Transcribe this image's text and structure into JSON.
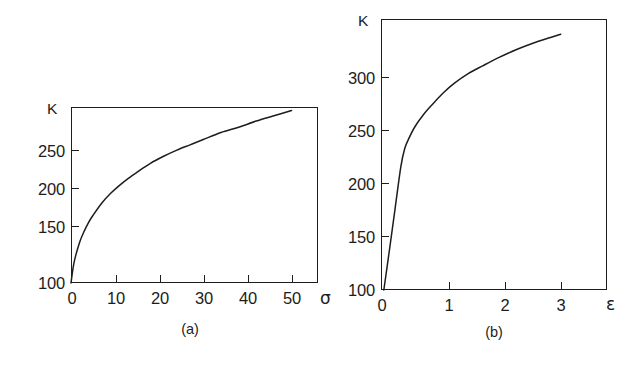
{
  "figure": {
    "background_color": "#ffffff",
    "ink_color": "#1d1d1d",
    "panels": [
      {
        "id": "a",
        "caption": "(a)",
        "y_axis_name": "K",
        "x_axis_name": "σ",
        "x_tick_labels": [
          "0",
          "10",
          "20",
          "30",
          "40",
          "50"
        ],
        "y_tick_labels": [
          "100",
          "150",
          "200",
          "250"
        ]
      },
      {
        "id": "b",
        "caption": "(b)",
        "y_axis_name": "K",
        "x_axis_name": "ε",
        "x_tick_labels": [
          "0",
          "1",
          "2",
          "3"
        ],
        "y_tick_labels": [
          "100",
          "150",
          "200",
          "250",
          "300"
        ]
      }
    ]
  },
  "chart_data": [
    {
      "type": "line",
      "panel": "a",
      "title": "(a)",
      "xlabel": "σ",
      "ylabel": "K",
      "xlim": [
        0,
        56
      ],
      "ylim": [
        100,
        300
      ],
      "xticks": [
        0,
        10,
        20,
        30,
        40,
        50
      ],
      "yticks": [
        100,
        150,
        200,
        250
      ],
      "grid": false,
      "legend": "none",
      "series": [
        {
          "name": "K vs sigma",
          "x": [
            0,
            0.5,
            1,
            2,
            3,
            4,
            5,
            7,
            9,
            11,
            13,
            15,
            18,
            21,
            24,
            27,
            30,
            34,
            38,
            42,
            46,
            50
          ],
          "y": [
            100,
            118,
            130,
            147,
            159,
            169,
            177,
            191,
            202,
            211,
            219,
            226,
            236,
            244,
            251,
            257,
            263,
            271,
            277,
            284,
            290,
            296
          ]
        }
      ]
    },
    {
      "type": "line",
      "panel": "b",
      "title": "(b)",
      "xlabel": "ε",
      "ylabel": "K",
      "xlim": [
        0,
        4.0
      ],
      "ylim": [
        100,
        349
      ],
      "xticks": [
        0,
        1,
        2,
        3
      ],
      "yticks": [
        100,
        150,
        200,
        250,
        300
      ],
      "grid": false,
      "legend": "none",
      "series": [
        {
          "name": "K vs epsilon",
          "x": [
            0.05,
            0.15,
            0.25,
            0.35,
            0.42,
            0.5,
            0.6,
            0.75,
            0.9,
            1.1,
            1.3,
            1.55,
            1.8,
            2.1,
            2.4,
            2.7,
            3.0,
            3.18
          ],
          "y": [
            100,
            137,
            175,
            213,
            230,
            240,
            250,
            261,
            270,
            281,
            290,
            299,
            306,
            314,
            321,
            327,
            332,
            335
          ]
        }
      ]
    }
  ]
}
